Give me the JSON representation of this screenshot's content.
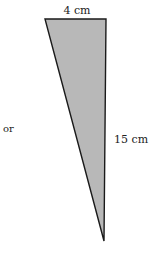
{
  "diagram": {
    "type": "right-triangle",
    "labels": {
      "top": "4 cm",
      "side": "15 cm",
      "left_text": "or"
    },
    "dimensions": {
      "base_cm": 4,
      "height_cm": 15
    },
    "colors": {
      "fill": "#b8b8b8",
      "stroke": "#1a1a1a",
      "text": "#222222"
    }
  }
}
